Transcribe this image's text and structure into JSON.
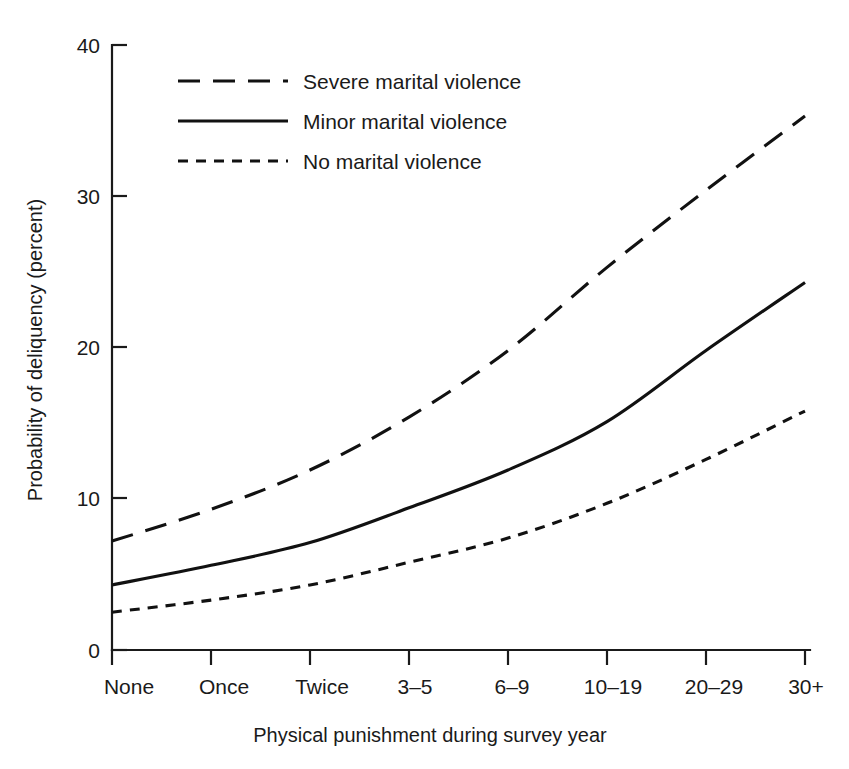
{
  "chart_data": {
    "type": "line",
    "title": "",
    "xlabel": "Physical punishment during survey year",
    "ylabel": "Probability of deliquency (percent)",
    "categories": [
      "None",
      "Once",
      "Twice",
      "3–5",
      "6–9",
      "10–19",
      "20–29",
      "30+"
    ],
    "ylim": [
      0,
      40
    ],
    "yticks": [
      0,
      10,
      20,
      30,
      40
    ],
    "ytick_labels": [
      "0",
      "10",
      "20",
      "30",
      "40"
    ],
    "grid": false,
    "legend_position": "upper-left-inside",
    "series": [
      {
        "name": "Severe marital violence",
        "style": "long-dash",
        "values": [
          7.2,
          9.3,
          11.9,
          15.4,
          19.8,
          25.3,
          30.4,
          35.3
        ]
      },
      {
        "name": "Minor marital violence",
        "style": "solid",
        "values": [
          4.3,
          5.6,
          7.1,
          9.4,
          11.9,
          15.1,
          19.8,
          24.3
        ]
      },
      {
        "name": "No marital violence",
        "style": "short-dash",
        "values": [
          2.5,
          3.3,
          4.3,
          5.8,
          7.4,
          9.7,
          12.6,
          15.8
        ]
      }
    ]
  },
  "axes": {
    "y_title": "Probability of deliquency (percent)",
    "x_title": "Physical punishment during survey year",
    "y_tick_labels": [
      "40",
      "30",
      "20",
      "10",
      "0"
    ],
    "x_tick_labels": [
      "None",
      "Once",
      "Twice",
      "3–5",
      "6–9",
      "10–19",
      "20–29",
      "30+"
    ]
  },
  "legend": {
    "items": [
      {
        "label": "Severe marital violence",
        "style": "long-dash"
      },
      {
        "label": "Minor marital violence",
        "style": "solid"
      },
      {
        "label": "No marital violence",
        "style": "short-dash"
      }
    ]
  },
  "colors": {
    "ink": "#1a1a1a",
    "line": "#111111",
    "background": "#ffffff"
  }
}
